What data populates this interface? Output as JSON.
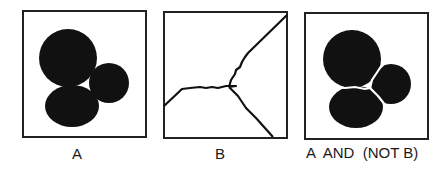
{
  "panels": [
    {
      "id": "A",
      "label": "A",
      "description": "binary image of three overlapping blobs"
    },
    {
      "id": "B",
      "label": "B",
      "description": "watershed lines separating the blobs"
    },
    {
      "id": "C",
      "label": "A  AND  (NOT B)",
      "description": "blobs separated by the watershed lines"
    }
  ],
  "colors": {
    "foreground": "#111111",
    "background": "#ffffff",
    "frame": "#222222"
  }
}
